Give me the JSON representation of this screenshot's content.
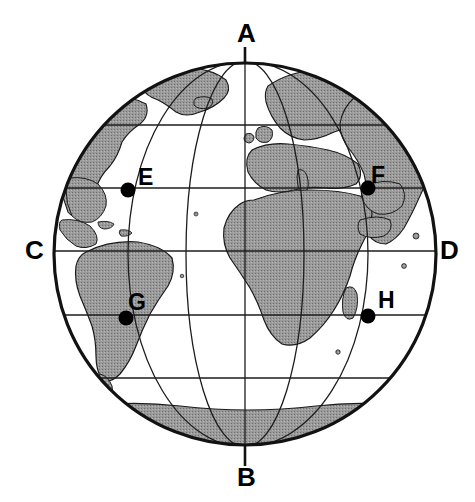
{
  "figure": {
    "title_remnant": "",
    "kind": "globe-diagram"
  },
  "colors": {
    "land_fill": "#9a9a9a",
    "ocean_fill": "#ffffff",
    "outline": "#111111",
    "graticule": "#222222",
    "label_text": "#000000",
    "point_marker": "#000000",
    "background": "#ffffff"
  },
  "globe": {
    "center_x": 245,
    "center_y": 254,
    "radius": 193,
    "outline_width": 3.2,
    "graticule_width": 1.3,
    "latitude_count": 5,
    "meridian_count": 5
  },
  "axis": {
    "name": "earth-axis",
    "top_x": 245,
    "top_y": 48,
    "bottom_x": 245,
    "bottom_y": 465,
    "stroke_width": 2.6
  },
  "cardinal_labels": [
    {
      "id": "A",
      "text": "A",
      "x": 237,
      "y": 20,
      "role": "north-pole-axis-top"
    },
    {
      "id": "B",
      "text": "B",
      "x": 237,
      "y": 464,
      "role": "south-pole-axis-bottom"
    },
    {
      "id": "C",
      "text": "C",
      "x": 25,
      "y": 237,
      "role": "west-equator-edge"
    },
    {
      "id": "D",
      "text": "D",
      "x": 440,
      "y": 237,
      "role": "east-equator-edge"
    }
  ],
  "marked_points": [
    {
      "id": "E",
      "text": "E",
      "dot_x": 128,
      "dot_y": 190,
      "label_x": 138,
      "label_y": 166,
      "radius": 7.5
    },
    {
      "id": "F",
      "text": "F",
      "dot_x": 368,
      "dot_y": 188,
      "label_x": 371,
      "label_y": 164,
      "radius": 7.5
    },
    {
      "id": "G",
      "text": "G",
      "dot_x": 126,
      "dot_y": 318,
      "label_x": 128,
      "label_y": 291,
      "radius": 7.5
    },
    {
      "id": "H",
      "text": "H",
      "dot_x": 368,
      "dot_y": 316,
      "label_x": 378,
      "label_y": 289,
      "radius": 7.5
    }
  ],
  "latitudes": [
    {
      "index": 0,
      "y": 125
    },
    {
      "index": 1,
      "y": 188
    },
    {
      "index": 2,
      "y": 251
    },
    {
      "index": 3,
      "y": 315
    },
    {
      "index": 4,
      "y": 378
    }
  ],
  "meridians": [
    {
      "index": 0,
      "equator_x": 128
    },
    {
      "index": 1,
      "equator_x": 186
    },
    {
      "index": 2,
      "equator_x": 245
    },
    {
      "index": 3,
      "equator_x": 304
    },
    {
      "index": 4,
      "equator_x": 368
    }
  ]
}
